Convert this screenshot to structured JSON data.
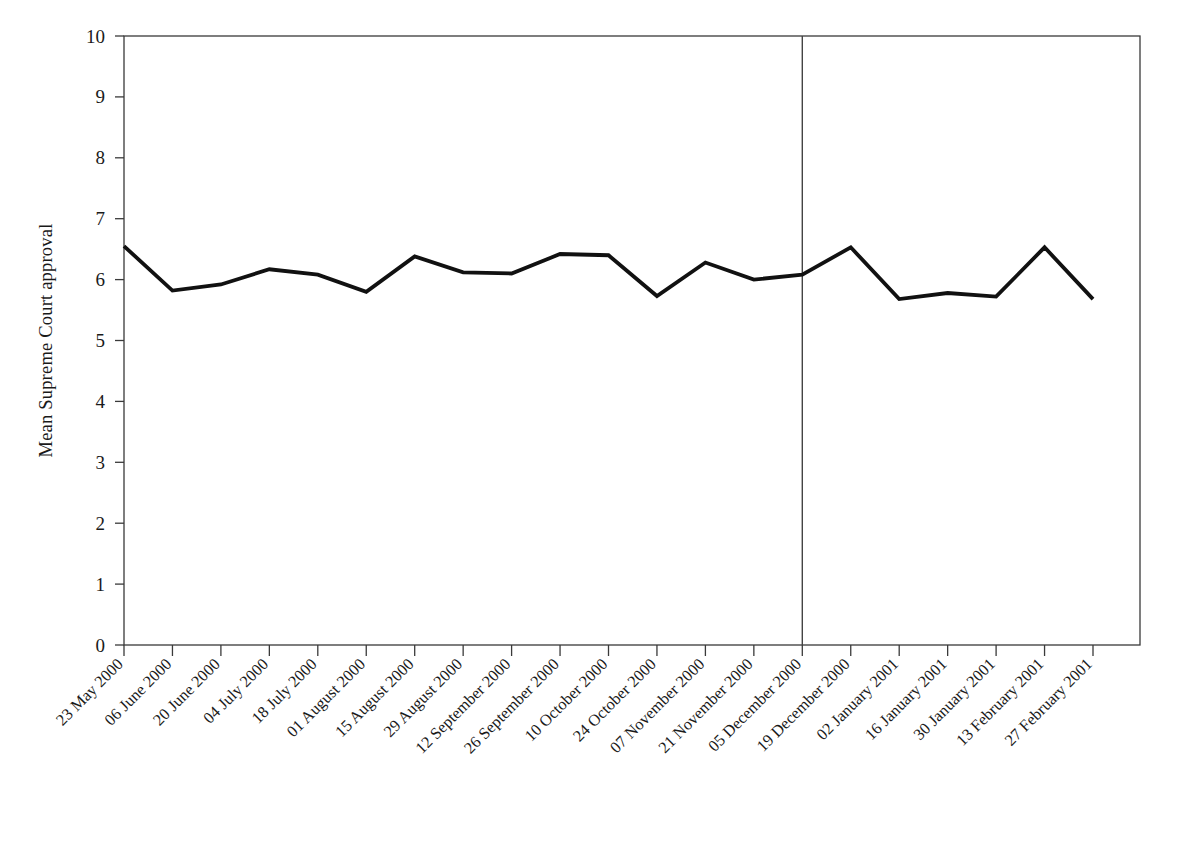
{
  "figure": {
    "background": "#ffffff",
    "line_color": "#111111",
    "axis_color": "#3a3a3a",
    "divider_color": "#444444"
  },
  "chart_data": {
    "type": "line",
    "title": "",
    "xlabel": "",
    "ylabel": "Mean Supreme Court approval",
    "ylim": [
      0,
      10
    ],
    "ytick_labels": [
      "0",
      "1",
      "2",
      "3",
      "4",
      "5",
      "6",
      "7",
      "8",
      "9",
      "10"
    ],
    "ytick_values": [
      0,
      1,
      2,
      3,
      4,
      5,
      6,
      7,
      8,
      9,
      10
    ],
    "grid": false,
    "legend": false,
    "legend_position": "none",
    "categories": [
      "23 May 2000",
      "06 June 2000",
      "20 June 2000",
      "04 July 2000",
      "18 July 2000",
      "01 August 2000",
      "15 August 2000",
      "29 August 2000",
      "12 September 2000",
      "26 September 2000",
      "10 October 2000",
      "24 October 2000",
      "07 November 2000",
      "21 November 2000",
      "05 December 2000",
      "19 December 2000",
      "02 January 2001",
      "16 January 2001",
      "30 January 2001",
      "13 February 2001",
      "27 February 2001"
    ],
    "values": [
      6.55,
      5.82,
      5.92,
      6.17,
      6.08,
      5.8,
      6.38,
      6.12,
      6.1,
      6.42,
      6.4,
      5.73,
      6.28,
      6.0,
      6.08,
      6.53,
      5.68,
      5.78,
      5.72,
      6.53,
      5.68
    ],
    "series": [
      {
        "name": "Mean Supreme Court approval",
        "values": [
          6.55,
          5.82,
          5.92,
          6.17,
          6.08,
          5.8,
          6.38,
          6.12,
          6.1,
          6.42,
          6.4,
          5.73,
          6.28,
          6.0,
          6.08,
          6.53,
          5.68,
          5.78,
          5.72,
          6.53,
          5.68
        ]
      }
    ],
    "annotations": [
      {
        "type": "vertical-line",
        "at_category": "05 December 2000",
        "at_index": 14,
        "label": ""
      }
    ]
  }
}
